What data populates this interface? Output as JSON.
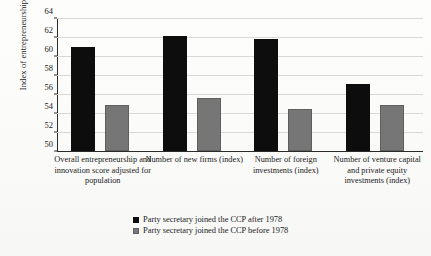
{
  "chart_data": {
    "type": "bar",
    "title": "",
    "xlabel": "",
    "ylabel": "Index of entrepreneurship",
    "ylim": [
      50,
      64
    ],
    "yticks": [
      50,
      52,
      54,
      56,
      58,
      60,
      62,
      64
    ],
    "grid": true,
    "legend_position": "bottom-center",
    "categories": [
      "Overall entrepreneurship and innovation score adjusted for population",
      "Number of new firms (index)",
      "Number of foreign investments (index)",
      "Number of venture capital and private equity investments (index)"
    ],
    "series": [
      {
        "name": "Party secretary joined the CCP after 1978",
        "color": "#0d0d0d",
        "values": [
          61.0,
          62.1,
          61.8,
          57.1
        ]
      },
      {
        "name": "Party secretary joined the CCP before 1978",
        "color": "#767676",
        "values": [
          54.8,
          55.6,
          54.4,
          54.8
        ]
      }
    ]
  },
  "legend": {
    "items": [
      {
        "label": "Party secretary joined the CCP after 1978",
        "swatch": "black"
      },
      {
        "label": "Party secretary joined the CCP before 1978",
        "swatch": "gray"
      }
    ]
  }
}
